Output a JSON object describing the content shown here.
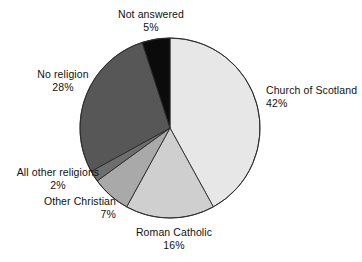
{
  "chart_data": {
    "type": "pie",
    "title": "",
    "subtitle": "",
    "xlabel": "",
    "ylabel": "",
    "legend_position": "none",
    "grid": false,
    "labels_position": "outside",
    "start_angle_deg": 0,
    "direction": "clockwise",
    "categories": [
      "Church of Scotland",
      "Roman Catholic",
      "Other Christian",
      "All other religions",
      "No religion",
      "Not answered"
    ],
    "values": [
      42,
      16,
      7,
      2,
      28,
      5
    ],
    "value_labels": [
      "42%",
      "16%",
      "7%",
      "2%",
      "28%",
      "5%"
    ],
    "units": "%",
    "total": 100,
    "colors": [
      "#e7e7e7",
      "#cfcfcf",
      "#a9a9a9",
      "#6e6e6e",
      "#575757",
      "#0b0b0b"
    ],
    "slices": [
      {
        "name": "Church of Scotland",
        "value": 42,
        "value_label": "42%",
        "color": "#e7e7e7",
        "label_align": "left"
      },
      {
        "name": "Roman Catholic",
        "value": 16,
        "value_label": "16%",
        "color": "#cfcfcf",
        "label_align": "center"
      },
      {
        "name": "Other Christian",
        "value": 7,
        "value_label": "7%",
        "color": "#a9a9a9",
        "label_align": "right"
      },
      {
        "name": "All other religions",
        "value": 2,
        "value_label": "2%",
        "color": "#6e6e6e",
        "label_align": "center"
      },
      {
        "name": "No religion",
        "value": 28,
        "value_label": "28%",
        "color": "#575757",
        "label_align": "center"
      },
      {
        "name": "Not answered",
        "value": 5,
        "value_label": "5%",
        "color": "#0b0b0b",
        "label_align": "center"
      }
    ],
    "geometry": {
      "center_x": 170,
      "center_y": 128,
      "radius": 90,
      "stroke_color": "#2a2a2a",
      "stroke_width": 0.9,
      "background": "#ffffff"
    }
  }
}
